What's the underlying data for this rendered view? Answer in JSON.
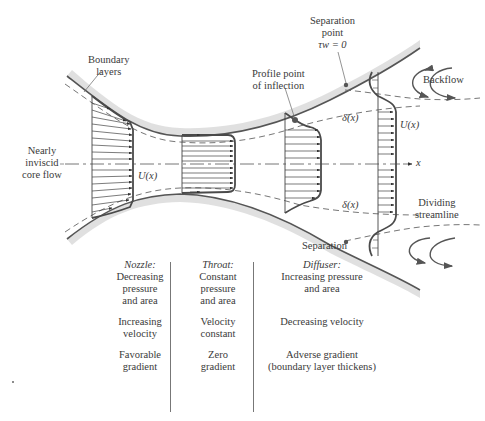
{
  "labels": {
    "boundary_layers": "Boundary\nlayers",
    "separation_point": [
      "Separation",
      "point",
      "τw = 0"
    ],
    "profile_inflection": [
      "Profile point",
      "of inflection"
    ],
    "backflow": "Backflow",
    "nearly_inviscid": [
      "Nearly",
      "inviscid",
      "core flow"
    ],
    "u_left": "U(x)",
    "u_right": "U(x)",
    "delta_top": "δ(x)",
    "delta_bottom": "δ(x)",
    "x_axis": "x",
    "dividing": [
      "Dividing",
      "streamline"
    ],
    "separation": "Separation"
  },
  "table": {
    "nozzle": {
      "title": "Nozzle",
      "pressure": [
        "Decreasing",
        "pressure",
        "and area"
      ],
      "velocity": [
        "Increasing",
        "velocity"
      ],
      "gradient": [
        "Favorable",
        "gradient"
      ]
    },
    "throat": {
      "title": "Throat",
      "pressure": [
        "Constant",
        "pressure",
        "and area"
      ],
      "velocity": [
        "Velocity",
        "constant"
      ],
      "gradient": [
        "Zero",
        "gradient"
      ]
    },
    "diffuser": {
      "title": "Diffuser",
      "pressure": [
        "Increasing pressure",
        "and area"
      ],
      "velocity": [
        "Decreasing velocity"
      ],
      "gradient": [
        "Adverse gradient",
        "(boundary layer thickens)"
      ]
    }
  },
  "colors": {
    "wall": "#555555",
    "profile": "#4a4a4a",
    "shade": "#cfcfcf"
  }
}
